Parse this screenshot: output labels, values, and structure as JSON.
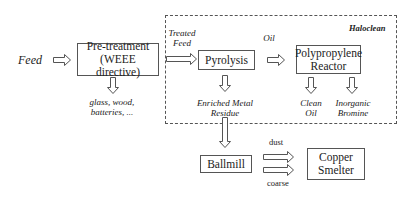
{
  "input": {
    "label": "Feed"
  },
  "boundary": {
    "label": "Haloclean"
  },
  "nodes": {
    "pretreatment": {
      "line1": "Pre-treatment",
      "line2": "(WEEE directive)"
    },
    "pyrolysis": {
      "label": "Pyrolysis"
    },
    "pp_reactor": {
      "line1": "Polypropylene",
      "line2": "Reactor"
    },
    "ballmill": {
      "label": "Ballmill"
    },
    "smelter": {
      "line1": "Copper",
      "line2": "Smelter"
    }
  },
  "flows": {
    "treated_feed": {
      "line1": "Treated",
      "line2": "Feed"
    },
    "oil": {
      "label": "Oil"
    },
    "rejects": {
      "line1": "glass, wood,",
      "line2": "batteries, ..."
    },
    "residue": {
      "line1": "Enriched Metal",
      "line2": "Residue"
    },
    "clean_oil": {
      "line1": "Clean",
      "line2": "Oil"
    },
    "bromine": {
      "line1": "Inorganic",
      "line2": "Bromine"
    },
    "dust": {
      "label": "dust"
    },
    "coarse": {
      "label": "coarse"
    }
  },
  "colors": {
    "stroke": "#555555",
    "text": "#222222",
    "background": "#ffffff"
  }
}
